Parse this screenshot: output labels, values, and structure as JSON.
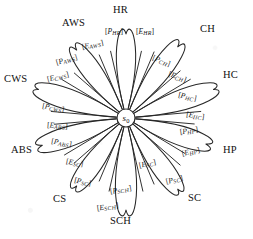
{
  "diagram": {
    "hub": {
      "label": "s",
      "subscript": "0",
      "name": "s0"
    },
    "bracket_open": "[",
    "bracket_close": "]",
    "symbol_p": "P",
    "symbol_e": "E",
    "petals": [
      {
        "id": "HR",
        "outer_label": "HR",
        "p_label": "P",
        "p_sub": "HR",
        "e_label": "E",
        "e_sub": "HR",
        "angle_deg": -90
      },
      {
        "id": "CH",
        "outer_label": "CH",
        "p_label": "P",
        "p_sub": "CH",
        "e_label": "E",
        "e_sub": "CH",
        "angle_deg": -54
      },
      {
        "id": "HC",
        "outer_label": "HC",
        "p_label": "P",
        "p_sub": "HC",
        "e_label": "E",
        "e_sub": "HC",
        "angle_deg": -18
      },
      {
        "id": "HP",
        "outer_label": "HP",
        "p_label": "P",
        "p_sub": "HP",
        "e_label": "E",
        "e_sub": "HP",
        "angle_deg": 18
      },
      {
        "id": "SC",
        "outer_label": "SC",
        "p_label": "P",
        "p_sub": "SC",
        "e_label": "E",
        "e_sub": "SC",
        "angle_deg": 54
      },
      {
        "id": "SCH",
        "outer_label": "SCH",
        "p_label": "P",
        "p_sub": "SCH",
        "e_label": "E",
        "e_sub": "SCH",
        "angle_deg": 90
      },
      {
        "id": "CS",
        "outer_label": "CS",
        "p_label": "P",
        "p_sub": "SC",
        "e_label": "E",
        "e_sub": "SC",
        "angle_deg": 126
      },
      {
        "id": "ABS",
        "outer_label": "ABS",
        "p_label": "P",
        "p_sub": "ABS",
        "e_label": "E",
        "e_sub": "ABS",
        "angle_deg": 162
      },
      {
        "id": "CWS",
        "outer_label": "CWS",
        "p_label": "P",
        "p_sub": "CWS",
        "e_label": "E",
        "e_sub": "CWS",
        "angle_deg": 198
      },
      {
        "id": "AWS",
        "outer_label": "AWS",
        "p_label": "P",
        "p_sub": "AWS",
        "e_label": "E",
        "e_sub": "AWS",
        "angle_deg": 234
      }
    ],
    "outer_label_positions": [
      {
        "id": "HR",
        "left": 113,
        "top": 5
      },
      {
        "id": "CH",
        "left": 200,
        "top": 24
      },
      {
        "id": "HC",
        "left": 223,
        "top": 70
      },
      {
        "id": "HP",
        "left": 223,
        "top": 145
      },
      {
        "id": "SC",
        "left": 188,
        "top": 193
      },
      {
        "id": "SCH",
        "left": 110,
        "top": 216
      },
      {
        "id": "CS",
        "left": 53,
        "top": 194
      },
      {
        "id": "ABS",
        "left": 11,
        "top": 145
      },
      {
        "id": "CWS",
        "left": 4,
        "top": 74
      },
      {
        "id": "AWS",
        "left": 62,
        "top": 18
      }
    ],
    "bracket_positions": [
      {
        "id": "HR",
        "p": {
          "left": 105,
          "top": 28,
          "rot": 0
        },
        "e": {
          "left": 136,
          "top": 28,
          "rot": 0
        }
      },
      {
        "id": "CH",
        "p": {
          "left": 152,
          "top": 57,
          "rot": 22
        },
        "e": {
          "left": 168,
          "top": 73,
          "rot": 20
        }
      },
      {
        "id": "HC",
        "p": {
          "left": 178,
          "top": 93,
          "rot": 12
        },
        "e": {
          "left": 186,
          "top": 112,
          "rot": 8
        }
      },
      {
        "id": "HP",
        "p": {
          "left": 180,
          "top": 127,
          "rot": -8
        },
        "e": {
          "left": 182,
          "top": 148,
          "rot": -14
        }
      },
      {
        "id": "SC",
        "p": {
          "left": 166,
          "top": 176,
          "rot": -14
        },
        "e": {
          "left": 139,
          "top": 160,
          "rot": -12
        }
      },
      {
        "id": "SCH",
        "p": {
          "left": 110,
          "top": 186,
          "rot": -10
        },
        "e": {
          "left": 97,
          "top": 203,
          "rot": -8
        }
      },
      {
        "id": "CS",
        "p": {
          "left": 74,
          "top": 178,
          "rot": 12
        },
        "e": {
          "left": 66,
          "top": 159,
          "rot": 10
        }
      },
      {
        "id": "ABS",
        "p": {
          "left": 51,
          "top": 139,
          "rot": 10
        },
        "e": {
          "left": 47,
          "top": 122,
          "rot": 4
        }
      },
      {
        "id": "CWS",
        "p": {
          "left": 42,
          "top": 104,
          "rot": 10
        },
        "e": {
          "left": 47,
          "top": 73,
          "rot": -14
        }
      },
      {
        "id": "AWS",
        "p": {
          "left": 56,
          "top": 56,
          "rot": -16
        },
        "e": {
          "left": 82,
          "top": 41,
          "rot": -12
        }
      }
    ],
    "geometry": {
      "center_x": 126,
      "center_y": 118,
      "hub_radius": 9,
      "petal_length": 88,
      "petal_width_deg": 13
    }
  }
}
